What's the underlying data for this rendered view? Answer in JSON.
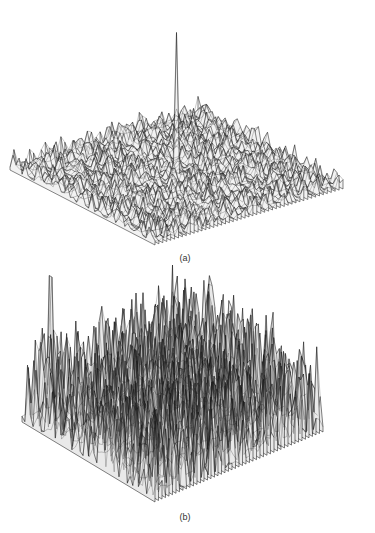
{
  "figure": {
    "panels": [
      {
        "label": "(a)"
      },
      {
        "label": "(b)"
      }
    ]
  },
  "chart_data": [
    {
      "type": "surface",
      "title": "",
      "panel_label": "(a)",
      "description": "3D wireframe surface: low-amplitude random noise floor with a single sharp central peak",
      "grid": {
        "rows": 48,
        "cols": 48
      },
      "noise_amplitude": 0.12,
      "peaks": [
        {
          "row_frac": 0.5,
          "col_frac": 0.5,
          "height": 1.0
        }
      ],
      "seed": 7,
      "projection": {
        "left": [
          10,
          168
        ],
        "top": [
          198,
          112
        ],
        "right": [
          360,
          190
        ],
        "bottom": [
          155,
          243
        ],
        "z_scale": 145
      },
      "stroke": "#222222",
      "fill": "#f2f2f2"
    },
    {
      "type": "surface",
      "title": "",
      "panel_label": "(b)",
      "description": "3D wireframe surface: high-amplitude random noise with a central peak and a secondary edge peak",
      "grid": {
        "rows": 48,
        "cols": 48
      },
      "noise_amplitude": 0.55,
      "peaks": [
        {
          "row_frac": 0.5,
          "col_frac": 0.5,
          "height": 1.0
        },
        {
          "row_frac": 0.15,
          "col_frac": 0.03,
          "height": 0.85
        }
      ],
      "seed": 19,
      "projection": {
        "left": [
          22,
          420
        ],
        "top": [
          190,
          350
        ],
        "right": [
          348,
          440
        ],
        "bottom": [
          155,
          500
        ],
        "z_scale": 160
      },
      "stroke": "#1a1a1a",
      "fill": "#e9e9e9"
    }
  ]
}
